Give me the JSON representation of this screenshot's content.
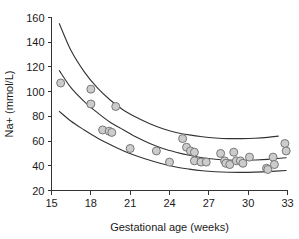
{
  "chart_data": {
    "type": "scatter",
    "title": "",
    "subtitle": "",
    "xlabel": "Gestational age (weeks)",
    "ylabel": "Na+ (mmol/L)",
    "xlim": [
      15,
      33
    ],
    "ylim": [
      20,
      160
    ],
    "xticks": [
      15,
      18,
      21,
      24,
      27,
      30,
      33
    ],
    "yticks": [
      20,
      40,
      60,
      80,
      100,
      120,
      140,
      160
    ],
    "grid": false,
    "legend": null,
    "marker": {
      "shape": "circle",
      "fill_color": "#cccccc",
      "edge_color": "#777777",
      "radius_px": 4
    },
    "curve_color": "#333333",
    "axis_color": "#333333",
    "points": [
      {
        "x": 15.7,
        "y": 107
      },
      {
        "x": 18.0,
        "y": 102
      },
      {
        "x": 18.0,
        "y": 90
      },
      {
        "x": 19.9,
        "y": 88
      },
      {
        "x": 18.9,
        "y": 69
      },
      {
        "x": 19.4,
        "y": 68
      },
      {
        "x": 19.6,
        "y": 67
      },
      {
        "x": 21.0,
        "y": 54
      },
      {
        "x": 23.0,
        "y": 52
      },
      {
        "x": 24.0,
        "y": 43
      },
      {
        "x": 25.0,
        "y": 62
      },
      {
        "x": 25.3,
        "y": 55
      },
      {
        "x": 25.6,
        "y": 52
      },
      {
        "x": 25.9,
        "y": 51
      },
      {
        "x": 25.9,
        "y": 44
      },
      {
        "x": 26.4,
        "y": 43
      },
      {
        "x": 26.8,
        "y": 43
      },
      {
        "x": 27.9,
        "y": 50
      },
      {
        "x": 28.2,
        "y": 44
      },
      {
        "x": 28.3,
        "y": 42
      },
      {
        "x": 28.6,
        "y": 41
      },
      {
        "x": 28.9,
        "y": 51
      },
      {
        "x": 29.1,
        "y": 44
      },
      {
        "x": 29.4,
        "y": 44
      },
      {
        "x": 29.6,
        "y": 42
      },
      {
        "x": 30.1,
        "y": 47
      },
      {
        "x": 31.4,
        "y": 38
      },
      {
        "x": 31.5,
        "y": 37
      },
      {
        "x": 31.9,
        "y": 47
      },
      {
        "x": 32.0,
        "y": 41
      },
      {
        "x": 32.8,
        "y": 58
      },
      {
        "x": 32.9,
        "y": 52
      }
    ],
    "curves": [
      {
        "name": "upper-reference-curve",
        "points": [
          {
            "x": 15.6,
            "y": 155
          },
          {
            "x": 16.5,
            "y": 133
          },
          {
            "x": 17.5,
            "y": 116
          },
          {
            "x": 18.5,
            "y": 103
          },
          {
            "x": 19.5,
            "y": 93
          },
          {
            "x": 20.5,
            "y": 85
          },
          {
            "x": 21.5,
            "y": 79
          },
          {
            "x": 22.5,
            "y": 74
          },
          {
            "x": 23.5,
            "y": 70
          },
          {
            "x": 24.5,
            "y": 67
          },
          {
            "x": 25.5,
            "y": 65
          },
          {
            "x": 26.5,
            "y": 63.5
          },
          {
            "x": 27.5,
            "y": 62.5
          },
          {
            "x": 28.5,
            "y": 62
          },
          {
            "x": 29.5,
            "y": 62
          },
          {
            "x": 30.5,
            "y": 62.3
          },
          {
            "x": 31.5,
            "y": 63
          },
          {
            "x": 32.3,
            "y": 64
          }
        ]
      },
      {
        "name": "median-reference-curve",
        "points": [
          {
            "x": 15.6,
            "y": 117
          },
          {
            "x": 16.5,
            "y": 103
          },
          {
            "x": 17.5,
            "y": 92
          },
          {
            "x": 18.5,
            "y": 83
          },
          {
            "x": 19.5,
            "y": 75
          },
          {
            "x": 20.5,
            "y": 69
          },
          {
            "x": 21.5,
            "y": 63
          },
          {
            "x": 22.5,
            "y": 58
          },
          {
            "x": 23.5,
            "y": 54
          },
          {
            "x": 24.5,
            "y": 51
          },
          {
            "x": 25.5,
            "y": 48.5
          },
          {
            "x": 26.5,
            "y": 46.5
          },
          {
            "x": 27.5,
            "y": 45.3
          },
          {
            "x": 28.5,
            "y": 44.7
          },
          {
            "x": 29.5,
            "y": 44.5
          },
          {
            "x": 30.5,
            "y": 44.7
          },
          {
            "x": 31.5,
            "y": 45.2
          },
          {
            "x": 32.9,
            "y": 46.5
          }
        ]
      },
      {
        "name": "lower-reference-curve",
        "points": [
          {
            "x": 15.6,
            "y": 84
          },
          {
            "x": 16.5,
            "y": 76
          },
          {
            "x": 17.5,
            "y": 69
          },
          {
            "x": 18.5,
            "y": 62.5
          },
          {
            "x": 19.5,
            "y": 57
          },
          {
            "x": 20.5,
            "y": 52
          },
          {
            "x": 21.5,
            "y": 48
          },
          {
            "x": 22.5,
            "y": 44.5
          },
          {
            "x": 23.5,
            "y": 41.5
          },
          {
            "x": 24.5,
            "y": 39
          },
          {
            "x": 25.5,
            "y": 37.3
          },
          {
            "x": 26.5,
            "y": 36
          },
          {
            "x": 27.5,
            "y": 35.2
          },
          {
            "x": 28.5,
            "y": 34.8
          },
          {
            "x": 29.5,
            "y": 34.7
          },
          {
            "x": 30.5,
            "y": 34.9
          },
          {
            "x": 31.5,
            "y": 35.3
          },
          {
            "x": 32.9,
            "y": 36.2
          }
        ]
      }
    ]
  }
}
